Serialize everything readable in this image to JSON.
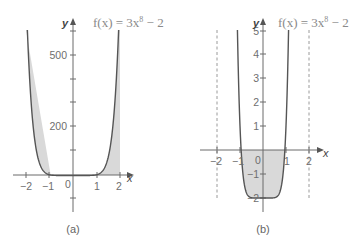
{
  "chart_data": [
    {
      "type": "line",
      "panel": "(a)",
      "title": "f(x) = 3x⁸ − 2",
      "function": "3x^8 - 2",
      "xlabel": "x",
      "ylabel": "y",
      "xlim": [
        -2.5,
        2.5
      ],
      "ylim": [
        -150,
        600
      ],
      "x_ticks": [
        -2,
        -1,
        0,
        1,
        2
      ],
      "x_tick_labels": [
        "−2",
        "−1",
        "0",
        "1",
        "2"
      ],
      "y_ticks": [
        -100,
        100,
        200,
        300,
        400,
        500,
        600
      ],
      "y_tick_labels": {
        "500": "500",
        "200": "200"
      },
      "shaded_region": {
        "from_x": -2,
        "to_x": 2,
        "between": "curve and x-axis"
      },
      "grid": false,
      "caption": "(a)"
    },
    {
      "type": "line",
      "panel": "(b)",
      "title": "f(x) = 3x⁸ − 2",
      "function": "3x^8 - 2",
      "xlabel": "x",
      "ylabel": "y",
      "xlim": [
        -2.5,
        2.5
      ],
      "ylim": [
        -2.5,
        5
      ],
      "x_ticks": [
        -2,
        -1,
        0,
        1,
        2
      ],
      "x_tick_labels": [
        "−2",
        "−1",
        "0",
        "1",
        "2"
      ],
      "y_ticks": [
        -2,
        -1,
        1,
        2,
        3,
        4,
        5
      ],
      "y_tick_labels": [
        "−2",
        "−1",
        "1",
        "2",
        "3",
        "4",
        "5"
      ],
      "vertical_dashed_lines": [
        -2,
        2
      ],
      "shaded_region": {
        "from_x": -0.917,
        "to_x": 0.917,
        "between": "curve and x-axis (below axis)"
      },
      "grid": false,
      "caption": "(b)"
    }
  ],
  "panel_a": {
    "title": "f(x) = 3x",
    "exponent": "8",
    "title_tail": " − 2",
    "x_label": "x",
    "y_label": "y",
    "y_tick_500": "500",
    "y_tick_200": "200",
    "x_ticks": [
      "−2",
      "−1",
      "0",
      "1",
      "2"
    ],
    "caption": "(a)"
  },
  "panel_b": {
    "title": "f(x) = 3x",
    "exponent": "8",
    "title_tail": " − 2",
    "x_label": "x",
    "y_label": "y",
    "y_ticks": [
      "5",
      "4",
      "3",
      "2",
      "1",
      "−1",
      "−2"
    ],
    "x_ticks": [
      "−2",
      "−1",
      "0",
      "1",
      "2"
    ],
    "caption": "(b)"
  }
}
